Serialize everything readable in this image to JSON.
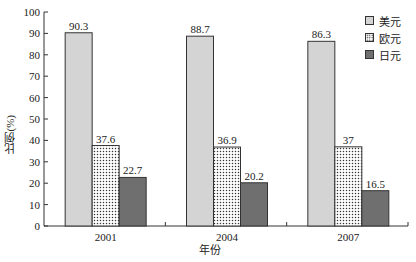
{
  "chart_data": {
    "type": "bar",
    "title": "",
    "xlabel": "年份",
    "ylabel": "比例(%)",
    "ylim": [
      0,
      100
    ],
    "yticks": [
      0,
      10,
      20,
      30,
      40,
      50,
      60,
      70,
      80,
      90,
      100
    ],
    "grid": false,
    "legend_position": "top-right",
    "categories": [
      "2001",
      "2004",
      "2007"
    ],
    "series": [
      {
        "name": "美元",
        "values": [
          90.3,
          88.7,
          86.3
        ],
        "fill": "#d4d4d4",
        "pattern": "solid-light-gray"
      },
      {
        "name": "欧元",
        "values": [
          37.6,
          36.9,
          37
        ],
        "fill": "#ffffff",
        "pattern": "dotted"
      },
      {
        "name": "日元",
        "values": [
          22.7,
          20.2,
          16.5
        ],
        "fill": "#6f6f6f",
        "pattern": "solid-dark-gray"
      }
    ],
    "value_labels": [
      [
        "90.3",
        "88.7",
        "86.3"
      ],
      [
        "37.6",
        "36.9",
        "37"
      ],
      [
        "22.7",
        "20.2",
        "16.5"
      ]
    ]
  },
  "legend": {
    "items": [
      {
        "label": "美元"
      },
      {
        "label": "欧元"
      },
      {
        "label": "日元"
      }
    ]
  },
  "axes": {
    "xlabel": "年份",
    "ylabel": "比例(%)"
  }
}
